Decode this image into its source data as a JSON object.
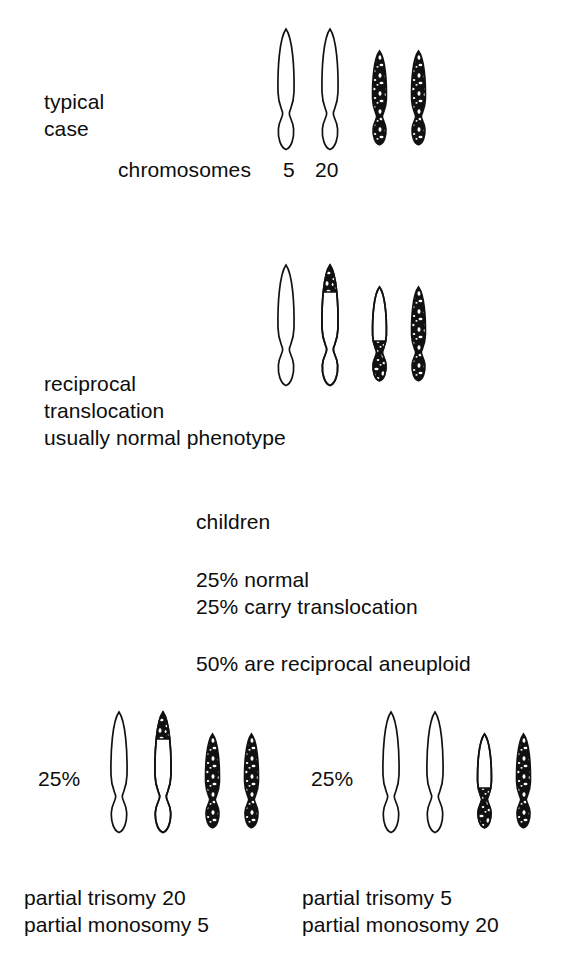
{
  "figure": {
    "type": "diagram",
    "background_color": "#ffffff",
    "ink_color": "#0d0d0d"
  },
  "sections": {
    "typical": {
      "label_line1": "typical",
      "label_line2": "case",
      "chromosome_caption": "chromosomes",
      "chr5_label": "5",
      "chr20_label": "20"
    },
    "carrier": {
      "label_line1": "reciprocal",
      "label_line2": "translocation",
      "label_line3": "usually normal phenotype"
    },
    "offspring": {
      "heading": "children",
      "outcome1": "25% normal",
      "outcome2": "25% carry translocation",
      "outcome3": "50% are reciprocal aneuploid"
    },
    "aneuploid_left": {
      "percent": "25%",
      "caption_line1": "partial trisomy 20",
      "caption_line2": "partial monosomy 5"
    },
    "aneuploid_right": {
      "percent": "25%",
      "caption_line1": "partial trisomy 5",
      "caption_line2": "partial monosomy 20"
    }
  }
}
